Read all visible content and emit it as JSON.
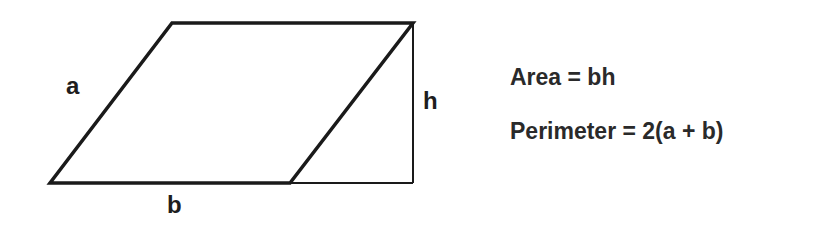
{
  "diagram": {
    "shape": "parallelogram",
    "labels": {
      "side": "a",
      "base": "b",
      "height": "h"
    },
    "vertices": {
      "top_left": [
        172,
        23
      ],
      "top_right": [
        413,
        23
      ],
      "bottom_right": [
        290,
        183
      ],
      "bottom_left": [
        50,
        183
      ]
    },
    "height_line": {
      "x": 413,
      "y_top": 23,
      "y_bottom": 183
    },
    "base_extension": {
      "x_start": 290,
      "x_end": 413,
      "y": 183
    },
    "stroke_color": "#1a1a1a"
  },
  "formulas": {
    "area": "Area = bh",
    "perimeter": "Perimeter = 2(a + b)"
  }
}
